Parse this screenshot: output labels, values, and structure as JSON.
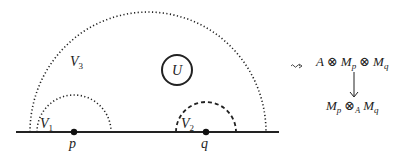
{
  "diagram": {
    "regions": {
      "V1": {
        "label": "V",
        "sub": "1",
        "style": "dotted"
      },
      "V2": {
        "label": "V",
        "sub": "2",
        "style": "dashed"
      },
      "V3": {
        "label": "V",
        "sub": "3",
        "style": "dotted"
      },
      "U": {
        "label": "U",
        "style": "solid circle"
      }
    },
    "points": {
      "p": {
        "label": "p"
      },
      "q": {
        "label": "q"
      }
    },
    "arrow_symbol": "⇝",
    "formula": {
      "top": {
        "a": "A",
        "otimes": "⊗",
        "m": "M",
        "p": "p",
        "q": "q"
      },
      "bottom": {
        "m": "M",
        "p": "p",
        "otimes": "⊗",
        "sub_a": "A",
        "q": "q"
      }
    },
    "colors": {
      "stroke": "#222222",
      "background": "#ffffff"
    }
  }
}
